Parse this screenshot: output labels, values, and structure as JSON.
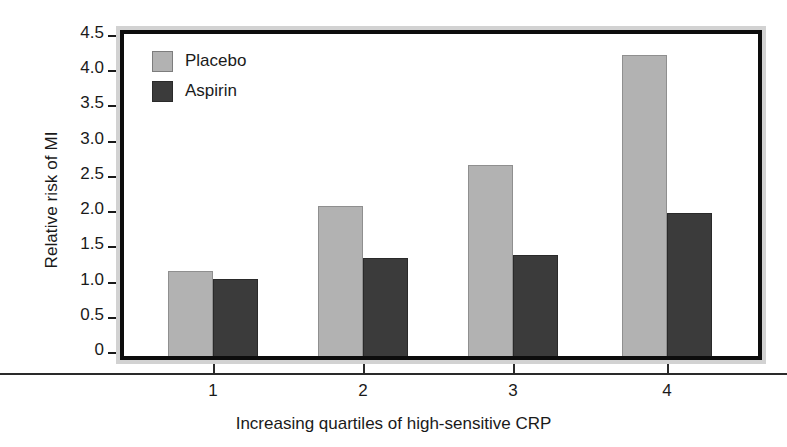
{
  "chart_data": {
    "type": "bar",
    "title": "",
    "xlabel": "Increasing quartiles of high-sensitive CRP",
    "ylabel": "Relative risk of MI",
    "categories": [
      "1",
      "2",
      "3",
      "4"
    ],
    "series": [
      {
        "name": "Placebo",
        "color": "#b2b2b2",
        "values": [
          1.15,
          2.07,
          2.66,
          4.22
        ]
      },
      {
        "name": "Aspirin",
        "color": "#3b3b3b",
        "values": [
          1.03,
          1.33,
          1.38,
          1.97
        ]
      }
    ],
    "ylim": [
      0,
      4.5
    ],
    "yticks": [
      "0",
      "0.5",
      "1.0",
      "1.5",
      "2.0",
      "2.5",
      "3.0",
      "3.5",
      "4.0",
      "4.5"
    ],
    "ytick_values": [
      0,
      0.5,
      1.0,
      1.5,
      2.0,
      2.5,
      3.0,
      3.5,
      4.0,
      4.5
    ],
    "grid": false,
    "legend_position": "top-left"
  },
  "legend": {
    "entries": [
      {
        "label": "Placebo"
      },
      {
        "label": "Aspirin"
      }
    ]
  },
  "axes": {
    "y_title": "Relative risk of MI",
    "x_title": "Increasing quartiles of high-sensitive CRP"
  },
  "colors": {
    "placebo": "#b2b2b2",
    "aspirin": "#3b3b3b",
    "frame": "#0d0d0d",
    "bevel": "#d2d2d2",
    "text": "#1a1a1a"
  }
}
